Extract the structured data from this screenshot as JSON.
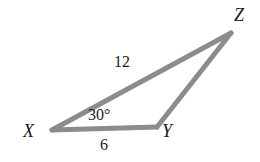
{
  "figure": {
    "kind": "triangle-diagram",
    "background_color": "#ffffff",
    "stroke_color": "#8c8c8c",
    "text_color": "#1a1a1a",
    "stroke_width": 5,
    "vertices": {
      "x": {
        "label": "X",
        "px": 52,
        "py": 130
      },
      "y": {
        "label": "Y",
        "px": 157,
        "py": 127
      },
      "z": {
        "label": "Z",
        "px": 231,
        "py": 33
      }
    },
    "labels": {
      "vertex_x": "X",
      "vertex_y": "Y",
      "vertex_z": "Z",
      "side_xz": "12",
      "side_xy": "6",
      "angle_x": "30°"
    }
  },
  "chart_data": {
    "type": "diagram",
    "title": "",
    "shape": "triangle",
    "vertices": [
      "X",
      "Y",
      "Z"
    ],
    "vertex_coordinates": [
      [
        52,
        130
      ],
      [
        157,
        127
      ],
      [
        231,
        33
      ]
    ],
    "side_labels": [
      {
        "from": "X",
        "to": "Z",
        "value": "12"
      },
      {
        "from": "X",
        "to": "Y",
        "value": "6"
      },
      {
        "from": "Y",
        "to": "Z",
        "value": ""
      }
    ],
    "angle_labels": [
      {
        "at": "X",
        "value": "30°"
      }
    ]
  }
}
